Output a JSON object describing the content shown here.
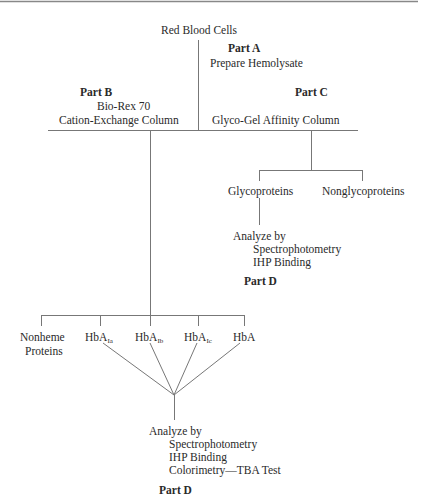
{
  "diagram": {
    "root": "Red Blood Cells",
    "part_a": {
      "label": "Part A",
      "text": "Prepare Hemolysate"
    },
    "part_b": {
      "label": "Part B",
      "line1": "Bio-Rex 70",
      "line2": "Cation-Exchange Column"
    },
    "part_c": {
      "label": "Part C",
      "text": "Glyco-Gel Affinity Column"
    },
    "glyco_branch": {
      "items": [
        "Glycoproteins",
        "Nonglycoproteins"
      ],
      "analyze": {
        "title": "Analyze by",
        "methods": [
          "Spectrophotometry",
          "IHP Binding"
        ],
        "part": "Part D"
      }
    },
    "bio_branch": {
      "items": [
        {
          "line1": "Nonheme",
          "line2": "Proteins"
        },
        {
          "base": "HbA",
          "sub": "Ia"
        },
        {
          "base": "HbA",
          "sub": "Ib"
        },
        {
          "base": "HbA",
          "sub": "Ic"
        },
        {
          "base": "HbA",
          "sub": ""
        }
      ],
      "analyze": {
        "title": "Analyze by",
        "methods": [
          "Spectrophotometry",
          "IHP Binding",
          "Colorimetry—TBA Test"
        ],
        "part": "Part D"
      }
    }
  }
}
